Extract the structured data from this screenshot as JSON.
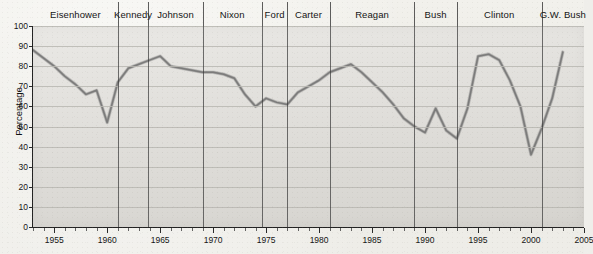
{
  "chart_data": {
    "type": "line",
    "title": "",
    "xlabel": "",
    "ylabel": "Percentage",
    "xlim": [
      1953,
      2005
    ],
    "ylim": [
      0,
      100
    ],
    "grid": true,
    "legend": "none",
    "x": [
      1953,
      1954,
      1955,
      1956,
      1957,
      1958,
      1959,
      1960,
      1961,
      1962,
      1963,
      1964,
      1965,
      1966,
      1967,
      1968,
      1969,
      1970,
      1971,
      1972,
      1973,
      1974,
      1975,
      1976,
      1977,
      1978,
      1979,
      1980,
      1981,
      1982,
      1983,
      1984,
      1985,
      1986,
      1987,
      1988,
      1989,
      1990,
      1991,
      1992,
      1993,
      1994,
      1995,
      1996,
      1997,
      1998,
      1999,
      2000,
      2001,
      2002,
      2003
    ],
    "values": [
      88,
      84,
      80,
      75,
      71,
      66,
      68,
      52,
      72,
      79,
      81,
      83,
      85,
      80,
      79,
      78,
      77,
      77,
      76,
      74,
      66,
      60,
      64,
      62,
      61,
      67,
      70,
      73,
      77,
      79,
      81,
      77,
      72,
      67,
      61,
      54,
      50,
      47,
      59,
      48,
      44,
      59,
      85,
      86,
      83,
      73,
      60,
      36,
      49,
      64,
      87
    ],
    "y_ticks": [
      0,
      10,
      20,
      30,
      40,
      50,
      60,
      70,
      80,
      90,
      100
    ],
    "x_ticks_major": [
      1955,
      1960,
      1965,
      1970,
      1975,
      1980,
      1985,
      1990,
      1995,
      2000,
      2005
    ],
    "x_tick_minor_step": 1,
    "series_color": "#6f6f6f",
    "annotations": {
      "presidents": [
        {
          "name": "Eisenhower",
          "start": 1953,
          "end": 1961
        },
        {
          "name": "Kennedy",
          "start": 1961,
          "end": 1963.9
        },
        {
          "name": "Johnson",
          "start": 1963.9,
          "end": 1969
        },
        {
          "name": "Nixon",
          "start": 1969,
          "end": 1974.6
        },
        {
          "name": "Ford",
          "start": 1974.6,
          "end": 1977
        },
        {
          "name": "Carter",
          "start": 1977,
          "end": 1981
        },
        {
          "name": "Reagan",
          "start": 1981,
          "end": 1989
        },
        {
          "name": "Bush",
          "start": 1989,
          "end": 1993
        },
        {
          "name": "Clinton",
          "start": 1993,
          "end": 2001
        },
        {
          "name": "G.W. Bush",
          "start": 2001,
          "end": 2005
        }
      ]
    }
  },
  "colors": {
    "plot_background": "#dedcd7",
    "page_background": "#efeeea",
    "gridline": "#b9b7b1",
    "axis": "#222222",
    "term_divider": "#3a3a3a",
    "line": "#6f6f6f"
  }
}
